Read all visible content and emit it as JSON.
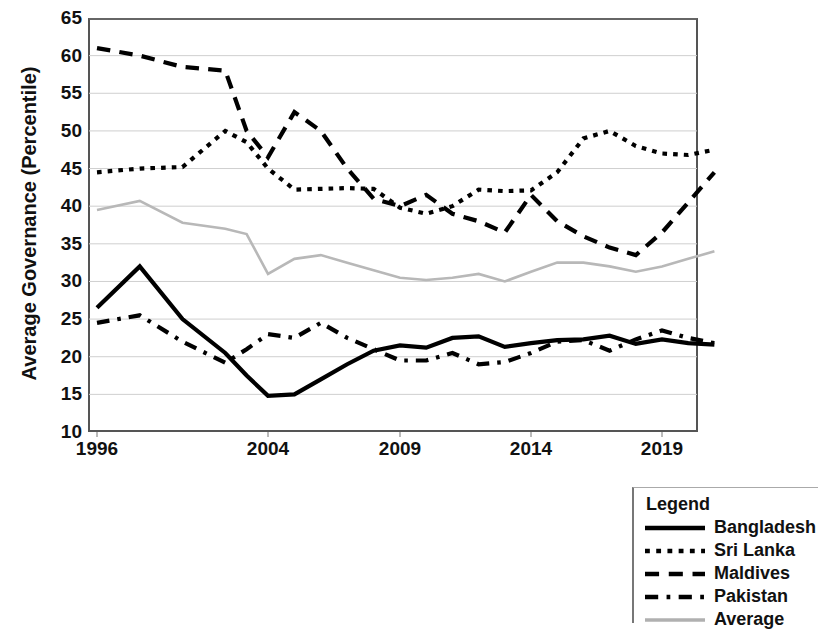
{
  "chart_data": {
    "type": "line",
    "title": "",
    "xlabel": "",
    "ylabel": "Average Governance (Percentile)",
    "ylim": [
      10,
      65
    ],
    "yticks": [
      10,
      15,
      20,
      25,
      30,
      35,
      40,
      45,
      50,
      55,
      60,
      65
    ],
    "xticks": [
      1996,
      2004,
      2009,
      2014,
      2019
    ],
    "xlim": [
      1996,
      2021
    ],
    "grid": "horizontal",
    "legend_position": "bottom-right",
    "legend_title": "Legend",
    "x": [
      1996,
      1998,
      2000,
      2002,
      2003,
      2004,
      2005,
      2006,
      2007,
      2008,
      2009,
      2010,
      2011,
      2012,
      2013,
      2014,
      2015,
      2016,
      2017,
      2018,
      2019,
      2020,
      2021
    ],
    "series": [
      {
        "name": "Bangladesh",
        "style": "solid",
        "color": "#000000",
        "values": [
          26.5,
          32.0,
          25.0,
          20.5,
          17.5,
          14.8,
          15.0,
          17.0,
          19.0,
          20.8,
          21.5,
          21.2,
          22.5,
          22.7,
          21.3,
          21.8,
          22.2,
          22.3,
          22.8,
          21.7,
          22.3,
          21.8,
          21.6
        ]
      },
      {
        "name": "Sri Lanka",
        "style": "dotted",
        "color": "#000000",
        "values": [
          44.5,
          45.0,
          45.2,
          50.0,
          48.5,
          45.0,
          42.2,
          42.3,
          42.4,
          42.3,
          39.8,
          39.0,
          40.0,
          42.2,
          42.0,
          42.1,
          44.5,
          49.0,
          50.0,
          48.0,
          47.0,
          46.8,
          47.5
        ]
      },
      {
        "name": "Maldives",
        "style": "dashed",
        "color": "#000000",
        "values": [
          61.0,
          60.0,
          58.5,
          58.0,
          50.0,
          46.5,
          52.5,
          50.0,
          45.0,
          41.0,
          40.0,
          41.5,
          39.0,
          38.0,
          36.5,
          41.5,
          38.0,
          36.0,
          34.5,
          33.5,
          36.5,
          40.5,
          44.5
        ]
      },
      {
        "name": "Pakistan",
        "style": "dashdot",
        "color": "#000000",
        "values": [
          24.5,
          25.5,
          22.0,
          19.2,
          21.0,
          23.0,
          22.5,
          24.5,
          22.5,
          21.0,
          19.5,
          19.5,
          20.5,
          19.0,
          19.3,
          20.5,
          22.0,
          22.2,
          20.8,
          22.3,
          23.5,
          22.5,
          21.8
        ]
      },
      {
        "name": "Average",
        "style": "solid",
        "color": "#b8b8b8",
        "values": [
          39.5,
          40.7,
          37.8,
          37.0,
          36.3,
          31.0,
          33.0,
          33.5,
          32.5,
          31.5,
          30.5,
          30.2,
          30.5,
          31.0,
          30.0,
          31.3,
          32.5,
          32.5,
          32.0,
          31.3,
          32.0,
          33.0,
          34.0
        ]
      }
    ]
  },
  "axis": {
    "ylabel": "Average Governance (Percentile)",
    "ytick_labels": [
      "65",
      "60",
      "55",
      "50",
      "45",
      "40",
      "35",
      "30",
      "25",
      "20",
      "15",
      "10"
    ],
    "xtick_labels": [
      "1996",
      "2004",
      "2009",
      "2014",
      "2019"
    ]
  },
  "legend": {
    "title": "Legend",
    "items": [
      {
        "label": "Bangladesh",
        "style": "solid",
        "color": "#000000"
      },
      {
        "label": "Sri Lanka",
        "style": "dotted",
        "color": "#000000"
      },
      {
        "label": "Maldives",
        "style": "dashed",
        "color": "#000000"
      },
      {
        "label": "Pakistan",
        "style": "dashdot",
        "color": "#000000"
      },
      {
        "label": "Average",
        "style": "solid-gray",
        "color": "#b0b0b0"
      }
    ]
  }
}
